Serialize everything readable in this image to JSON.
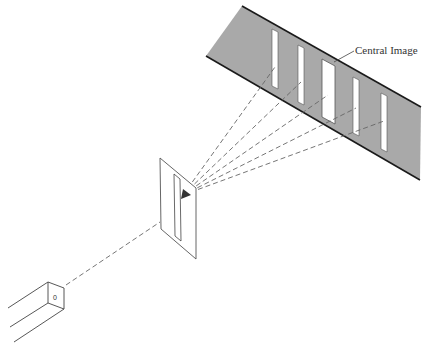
{
  "diagram": {
    "type": "double-slit-style diffraction apparatus (single slit to screen)",
    "colors": {
      "background": "#ffffff",
      "screen_fill": "#a9a9a9",
      "line": "#444444",
      "screen_edge": "#1a1a1a",
      "slit_fill": "#ffffff"
    },
    "labels": {
      "central_image": "Central Image",
      "source_mark": "0"
    },
    "components": {
      "source_box": "light source (rectangular tube) at lower left",
      "slit_card": "card with single vertical slit in middle",
      "screen": "gray screen at upper right with five bright image bands"
    },
    "screen_images_count": 5,
    "ray_count": 5
  }
}
